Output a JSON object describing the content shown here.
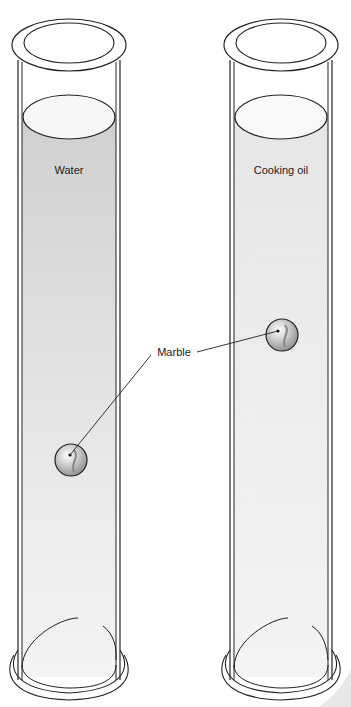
{
  "diagram": {
    "cylinders": [
      {
        "id": "left",
        "liquid_label": "Water",
        "liquid_color": "#d6d6d6",
        "surface_color": "#f7f7f7"
      },
      {
        "id": "right",
        "liquid_label": "Cooking oil",
        "liquid_color": "#ececec",
        "surface_color": "#f9f9f9"
      }
    ],
    "callout": {
      "label": "Marble"
    },
    "colors": {
      "stroke": "#222222",
      "marble": "#bfbfbf"
    }
  }
}
